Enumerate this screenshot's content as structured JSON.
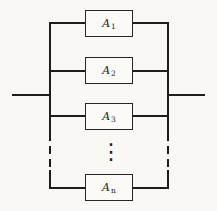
{
  "diagram": {
    "blocks": [
      {
        "label": "A",
        "sub": "1"
      },
      {
        "label": "A",
        "sub": "2"
      },
      {
        "label": "A",
        "sub": "3"
      },
      {
        "label": "A",
        "sub": "n"
      }
    ],
    "ellipsis": "⋮",
    "colors": {
      "background": "#f9f8f4",
      "line": "#1d1d1b",
      "block_fill": "#fbfaf6"
    }
  }
}
